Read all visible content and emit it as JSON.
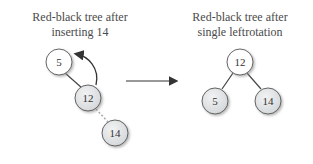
{
  "left_panel": {
    "title_line1": "Red-black tree after",
    "title_line2": "inserting 14",
    "nodes": [
      {
        "key": "5",
        "color": "white"
      },
      {
        "key": "12",
        "color": "gray"
      },
      {
        "key": "14",
        "color": "gray"
      }
    ],
    "edges": [
      {
        "from": "5",
        "to": "12",
        "style": "solid"
      },
      {
        "from": "12",
        "to": "14",
        "style": "dotted"
      }
    ],
    "rotation_arrow": "curved arrow from 12 toward 5"
  },
  "transition_arrow": "right-arrow",
  "right_panel": {
    "title_line1": "Red-black tree after",
    "title_line2": "single leftrotation",
    "nodes": [
      {
        "key": "12",
        "color": "white"
      },
      {
        "key": "5",
        "color": "gray"
      },
      {
        "key": "14",
        "color": "gray"
      }
    ],
    "edges": [
      {
        "from": "12",
        "to": "5",
        "style": "solid"
      },
      {
        "from": "12",
        "to": "14",
        "style": "solid"
      }
    ]
  },
  "colors": {
    "white_node": "#ffffff",
    "gray_node": "#e2e4e6",
    "stroke": "#555555",
    "text": "#444444"
  }
}
